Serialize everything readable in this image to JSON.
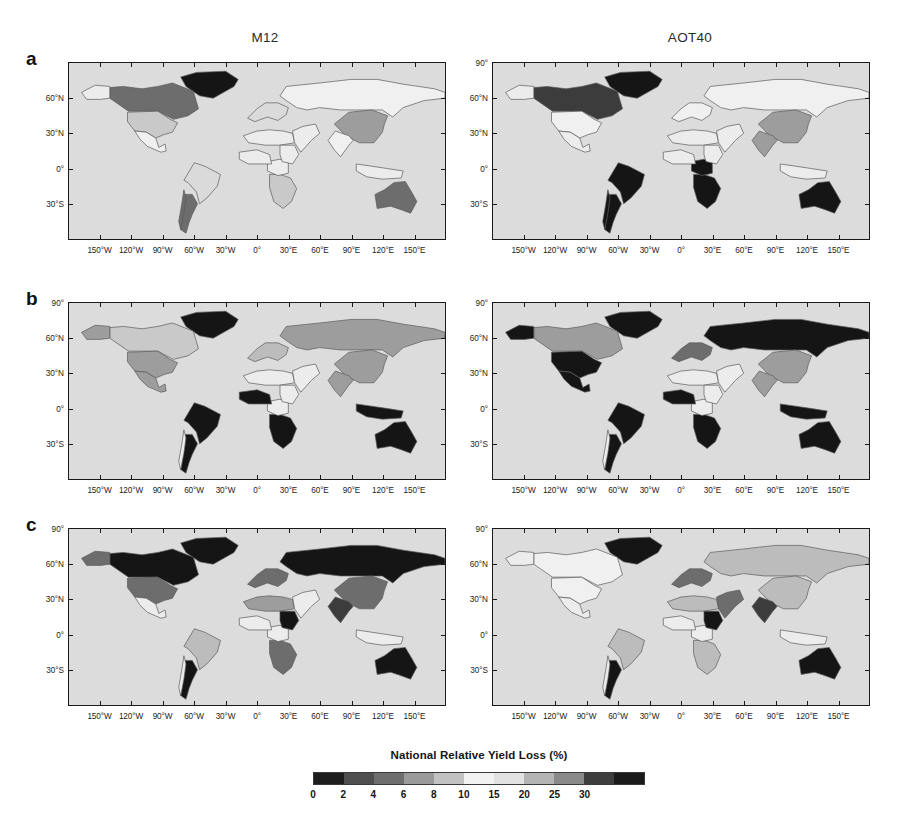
{
  "figure": {
    "column_headers": [
      "M12",
      "AOT40"
    ],
    "panel_letters": [
      "a",
      "b",
      "c"
    ],
    "colorbar_title": "National Relative Yield Loss (%)"
  },
  "axes": {
    "x_ticks": [
      "150°W",
      "120°W",
      "90°W",
      "60°W",
      "30°W",
      "0°",
      "30°E",
      "60°E",
      "90°E",
      "120°E",
      "150°E"
    ],
    "x_values": [
      -150,
      -120,
      -90,
      -60,
      -30,
      0,
      30,
      60,
      90,
      120,
      150
    ],
    "y_ticks": [
      "60°N",
      "30°N",
      "0°",
      "30°S"
    ],
    "y_values": [
      60,
      30,
      0,
      -30
    ],
    "y_top_label": "90°",
    "x_range": [
      -180,
      180
    ],
    "y_range": [
      -60,
      90
    ]
  },
  "chart_data": {
    "type": "heatmap",
    "title": "National Relative Yield Loss (%)",
    "xlabel": "Longitude",
    "ylabel": "Latitude",
    "projection": "cylindrical-equidistant",
    "xlim": [
      -180,
      180
    ],
    "ylim": [
      -60,
      90
    ],
    "grid": false,
    "legend": "horizontal colorbar below panels",
    "colorbar": {
      "label": "National Relative Yield Loss (%)",
      "tick_labels": [
        "0",
        "2",
        "4",
        "6",
        "8",
        "10",
        "15",
        "20",
        "25",
        "30"
      ],
      "tick_values": [
        0,
        2,
        4,
        6,
        8,
        10,
        15,
        20,
        25,
        30
      ],
      "bin_colors": [
        "#1d1d1d",
        "#4f4f4f",
        "#6e6e6e",
        "#9a9a9a",
        "#c2c2c2",
        "#f2f2f2",
        "#e2e2e2",
        "#b4b4b4",
        "#8a8a8a",
        "#3d3d3d",
        "#1a1a1a"
      ],
      "orientation": "horizontal"
    },
    "panels": [
      {
        "letter": "a",
        "columns": [
          {
            "metric": "M12",
            "regions": [
              {
                "name": "Canada",
                "class": "v-20"
              },
              {
                "name": "Greenland",
                "class": "v-30"
              },
              {
                "name": "United States",
                "class": "v-06"
              },
              {
                "name": "Mexico",
                "class": "v-02"
              },
              {
                "name": "Brazil",
                "class": "v-04"
              },
              {
                "name": "Argentina",
                "class": "v-20"
              },
              {
                "name": "Chile",
                "class": "v-20"
              },
              {
                "name": "China",
                "class": "v-15"
              },
              {
                "name": "Australia",
                "class": "v-20"
              },
              {
                "name": "Southern Africa",
                "class": "v-06"
              },
              {
                "name": "Europe",
                "class": "v-04"
              },
              {
                "name": "Russia",
                "class": "v-02"
              },
              {
                "name": "India",
                "class": "v-02"
              },
              {
                "name": "Africa (rest)",
                "class": "v-02"
              }
            ]
          },
          {
            "metric": "AOT40",
            "regions": [
              {
                "name": "Canada",
                "class": "v-25"
              },
              {
                "name": "Greenland",
                "class": "v-30"
              },
              {
                "name": "United States",
                "class": "v-02"
              },
              {
                "name": "Brazil",
                "class": "v-30"
              },
              {
                "name": "Argentina",
                "class": "v-30"
              },
              {
                "name": "Chile",
                "class": "v-30"
              },
              {
                "name": "China",
                "class": "v-15"
              },
              {
                "name": "India",
                "class": "v-15"
              },
              {
                "name": "Australia",
                "class": "v-30"
              },
              {
                "name": "Southern Africa",
                "class": "v-30"
              },
              {
                "name": "Central Africa",
                "class": "v-30"
              },
              {
                "name": "Europe",
                "class": "v-02"
              },
              {
                "name": "Russia",
                "class": "v-02"
              }
            ]
          }
        ]
      },
      {
        "letter": "b",
        "columns": [
          {
            "metric": "M12",
            "regions": [
              {
                "name": "Canada",
                "class": "v-06"
              },
              {
                "name": "Greenland",
                "class": "v-30"
              },
              {
                "name": "Alaska",
                "class": "v-15"
              },
              {
                "name": "United States",
                "class": "v-15"
              },
              {
                "name": "Mexico",
                "class": "v-15"
              },
              {
                "name": "Brazil",
                "class": "v-30"
              },
              {
                "name": "Argentina",
                "class": "v-30"
              },
              {
                "name": "Russia",
                "class": "v-15"
              },
              {
                "name": "China",
                "class": "v-15"
              },
              {
                "name": "India",
                "class": "v-15"
              },
              {
                "name": "Australia",
                "class": "v-30"
              },
              {
                "name": "Southern Africa",
                "class": "v-30"
              },
              {
                "name": "West Africa",
                "class": "v-30"
              },
              {
                "name": "Europe",
                "class": "v-10"
              },
              {
                "name": "Indonesia",
                "class": "v-30"
              }
            ]
          },
          {
            "metric": "AOT40",
            "regions": [
              {
                "name": "Canada",
                "class": "v-15"
              },
              {
                "name": "Greenland",
                "class": "v-30"
              },
              {
                "name": "Alaska",
                "class": "v-30"
              },
              {
                "name": "United States",
                "class": "v-30"
              },
              {
                "name": "Mexico",
                "class": "v-30"
              },
              {
                "name": "Brazil",
                "class": "v-30"
              },
              {
                "name": "Argentina",
                "class": "v-30"
              },
              {
                "name": "Russia",
                "class": "v-30"
              },
              {
                "name": "China",
                "class": "v-15"
              },
              {
                "name": "India",
                "class": "v-15"
              },
              {
                "name": "Australia",
                "class": "v-30"
              },
              {
                "name": "Southern Africa",
                "class": "v-30"
              },
              {
                "name": "West Africa",
                "class": "v-30"
              },
              {
                "name": "Europe",
                "class": "v-20"
              },
              {
                "name": "Indonesia",
                "class": "v-30"
              }
            ]
          }
        ]
      },
      {
        "letter": "c",
        "columns": [
          {
            "metric": "M12",
            "regions": [
              {
                "name": "Canada",
                "class": "v-30"
              },
              {
                "name": "Greenland",
                "class": "v-30"
              },
              {
                "name": "Alaska",
                "class": "v-20"
              },
              {
                "name": "United States",
                "class": "v-20"
              },
              {
                "name": "Brazil",
                "class": "v-10"
              },
              {
                "name": "Argentina",
                "class": "v-30"
              },
              {
                "name": "Russia",
                "class": "v-30"
              },
              {
                "name": "China",
                "class": "v-20"
              },
              {
                "name": "India",
                "class": "v-25"
              },
              {
                "name": "Australia",
                "class": "v-30"
              },
              {
                "name": "Sudan",
                "class": "v-30"
              },
              {
                "name": "Southern Africa",
                "class": "v-20"
              },
              {
                "name": "North Africa",
                "class": "v-15"
              },
              {
                "name": "Europe",
                "class": "v-20"
              }
            ]
          },
          {
            "metric": "AOT40",
            "regions": [
              {
                "name": "Greenland",
                "class": "v-30"
              },
              {
                "name": "Canada",
                "class": "v-02"
              },
              {
                "name": "United States",
                "class": "v-02"
              },
              {
                "name": "Brazil",
                "class": "v-10"
              },
              {
                "name": "Argentina",
                "class": "v-30"
              },
              {
                "name": "Russia",
                "class": "v-10"
              },
              {
                "name": "China",
                "class": "v-10"
              },
              {
                "name": "India",
                "class": "v-25"
              },
              {
                "name": "Australia",
                "class": "v-30"
              },
              {
                "name": "Sudan",
                "class": "v-30"
              },
              {
                "name": "Middle East",
                "class": "v-20"
              },
              {
                "name": "North Africa",
                "class": "v-10"
              },
              {
                "name": "Southern Africa",
                "class": "v-10"
              },
              {
                "name": "Europe",
                "class": "v-20"
              }
            ]
          }
        ]
      }
    ]
  }
}
